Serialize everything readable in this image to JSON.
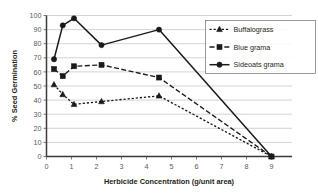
{
  "chart_data": {
    "type": "line",
    "title": "",
    "xlabel": "Herbicide Concentration (g/unit area)",
    "ylabel": "% Seed Germination",
    "xlim": [
      0,
      9
    ],
    "ylim": [
      0,
      100
    ],
    "xticks": [
      0,
      1,
      2,
      3,
      4,
      5,
      6,
      7,
      8,
      9
    ],
    "yticks": [
      0,
      10,
      20,
      30,
      40,
      50,
      60,
      70,
      80,
      90,
      100
    ],
    "xtick_labels": [
      "0",
      "1",
      "2",
      "3",
      "4",
      "5",
      "6",
      "7",
      "8",
      "9"
    ],
    "ytick_labels": [
      "0",
      "10",
      "20",
      "30",
      "40",
      "50",
      "60",
      "70",
      "80",
      "90",
      "100"
    ],
    "grid": "horizontal",
    "legend_position": "upper-right",
    "series": [
      {
        "name": "Buffalograss",
        "marker": "triangle",
        "linestyle": "dotted",
        "color": "#1a1a1a",
        "x": [
          0.3,
          0.65,
          1.1,
          2.2,
          4.5,
          9.0
        ],
        "values": [
          51,
          44,
          37,
          39,
          43,
          0
        ]
      },
      {
        "name": "Blue grama",
        "marker": "square",
        "linestyle": "dashed",
        "color": "#1a1a1a",
        "x": [
          0.3,
          0.65,
          1.1,
          2.2,
          4.5,
          9.0
        ],
        "values": [
          62,
          57,
          64,
          65,
          56,
          0
        ]
      },
      {
        "name": "Sideoats grama",
        "marker": "circle",
        "linestyle": "solid",
        "color": "#1a1a1a",
        "x": [
          0.3,
          0.65,
          1.1,
          2.2,
          4.5,
          9.0
        ],
        "values": [
          69,
          93,
          98,
          79,
          90,
          0
        ]
      }
    ]
  },
  "legend": {
    "items": [
      {
        "label": "Buffalograss"
      },
      {
        "label": "Blue grama"
      },
      {
        "label": "Sideoats grama"
      }
    ]
  }
}
